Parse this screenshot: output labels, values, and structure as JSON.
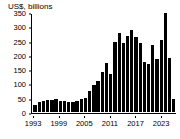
{
  "chart_data": {
    "type": "bar",
    "title": "",
    "subtitle": "",
    "ylabel": "US$, billions",
    "xlabel": "",
    "ylim": [
      0,
      350
    ],
    "y_ticks": [
      0,
      50,
      100,
      150,
      200,
      250,
      300,
      350
    ],
    "y_tick_labels": [
      "0",
      "50",
      "100",
      "150",
      "200",
      "250",
      "300",
      "350"
    ],
    "x_tick_labels": [
      "1993",
      "1999",
      "2005",
      "2011",
      "2017",
      "2023"
    ],
    "grid": false,
    "legend": null,
    "bar_color": "#000000",
    "categories": [
      "1993",
      "1994",
      "1995",
      "1996",
      "1997",
      "1998",
      "1999",
      "2000",
      "2001",
      "2002",
      "2003",
      "2004",
      "2005",
      "2006",
      "2007",
      "2008",
      "2009",
      "2010",
      "2011",
      "2012",
      "2013",
      "2014",
      "2015",
      "2016",
      "2017",
      "2018",
      "2019",
      "2020",
      "2021",
      "2022",
      "2023"
    ],
    "values": [
      26,
      36,
      37,
      42,
      42,
      44,
      40,
      38,
      36,
      35,
      38,
      47,
      48,
      72,
      94,
      110,
      140,
      172,
      132,
      245,
      277,
      243,
      266,
      288,
      262,
      240,
      175,
      168,
      236,
      186,
      252
    ],
    "extra_values": [
      345,
      190,
      44
    ]
  },
  "axis_title": "US$, billions"
}
